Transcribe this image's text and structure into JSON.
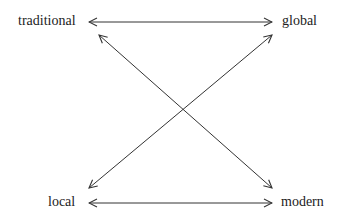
{
  "diagram": {
    "nodes": {
      "top_left": "traditional",
      "top_right": "global",
      "bottom_left": "local",
      "bottom_right": "modern"
    },
    "edges": [
      {
        "from": "traditional",
        "to": "global",
        "type": "bidirectional"
      },
      {
        "from": "local",
        "to": "modern",
        "type": "bidirectional"
      },
      {
        "from": "traditional",
        "to": "modern",
        "type": "bidirectional"
      },
      {
        "from": "local",
        "to": "global",
        "type": "bidirectional"
      }
    ],
    "colors": {
      "line": "#333333",
      "text": "#222222",
      "background": "#ffffff"
    }
  }
}
